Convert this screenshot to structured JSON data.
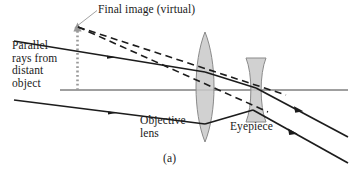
{
  "figure": {
    "panel_caption": "(a)",
    "labels": {
      "final_image": "Final image (virtual)",
      "parallel_rays": "Parallel\nrays from\ndistant\nobject",
      "objective_lens": "Objective\nlens",
      "eyepiece": "Eyepiece"
    },
    "colors": {
      "background": "#ffffff",
      "ray_stroke": "#1c1c1c",
      "axis_stroke": "#2a2a2a",
      "dashed_stroke": "#1c1c1c",
      "lens_fill": "#c9c9c9",
      "lens_stroke": "#8a8a8a",
      "image_arrow": "#9a9a9a",
      "leader_stroke": "#8a8a8a",
      "text": "#1a1a1a"
    },
    "elements": {
      "objective_lens_type": "biconvex-converging-lens",
      "eyepiece_type": "biconcave-diverging-lens",
      "optical_axis": "horizontal-axis",
      "virtual_image_marker": "dotted-vertical-line-with-up-arrow",
      "incoming_rays_count": 2,
      "outgoing_rays_count": 2,
      "dashed_construction_lines_count": 2
    }
  }
}
